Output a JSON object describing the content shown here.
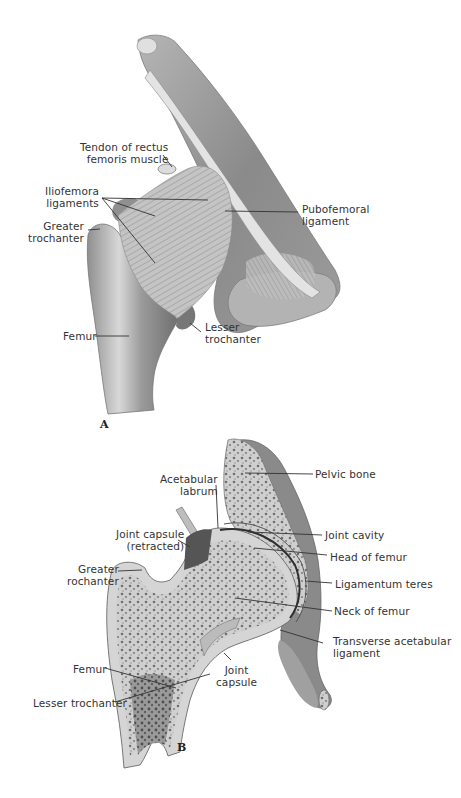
{
  "figure": {
    "panel_a": {
      "letter": "A",
      "labels": {
        "tendon_rectus_1": "Tendon of rectus",
        "tendon_rectus_2": "femoris muscle",
        "iliofemoral_1": "Iliofemora",
        "iliofemoral_2": "ligaments",
        "greater_trochanter_1": "Greater",
        "greater_trochanter_2": "trochanter",
        "pubofemoral_1": "Pubofemoral",
        "pubofemoral_2": "ligament",
        "femur": "Femur",
        "lesser_trochanter_1": "Lesser",
        "lesser_trochanter_2": "trochanter"
      }
    },
    "panel_b": {
      "letter": "B",
      "labels": {
        "acetabular_labrum_1": "Acetabular",
        "acetabular_labrum_2": "labrum",
        "pelvic_bone": "Pelvic bone",
        "joint_capsule_retracted_1": "Joint capsule",
        "joint_capsule_retracted_2": "(retracted)",
        "joint_cavity": "Joint cavity",
        "head_of_femur": "Head of femur",
        "greater_trochanter_1": "Greater",
        "greater_trochanter_2": "rochanter",
        "ligamentum_teres": "Ligamentum teres",
        "neck_of_femur": "Neck of femur",
        "transverse_acetabular_1": "Transverse acetabular",
        "transverse_acetabular_2": "ligament",
        "femur": "Femur",
        "joint_capsule_1": "Joint",
        "joint_capsule_2": "capsule",
        "lesser_trochanter": "Lesser trochanter"
      }
    },
    "colors": {
      "background": "#ffffff",
      "bone_light": "#d9d9d9",
      "bone_mid": "#a8a8a8",
      "bone_dark": "#6e6e6e",
      "leader_line": "#333333"
    }
  }
}
